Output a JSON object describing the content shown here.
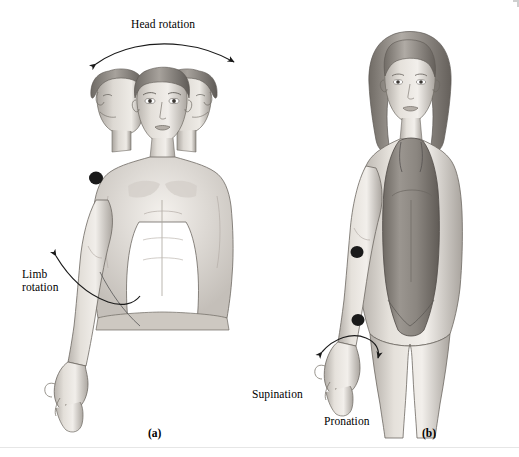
{
  "figure": {
    "background_color": "#ffffff",
    "ink_color": "#1a1a1a"
  },
  "panel_a": {
    "letter": "(a)",
    "subject": "male-figure-three-head-positions-torso",
    "labels": {
      "head_rotation": "Head rotation",
      "limb_rotation": "Limb\nrotation"
    },
    "markers": [
      {
        "name": "shoulder-joint-marker"
      },
      {
        "name": "elbow-pivot-marker"
      }
    ]
  },
  "panel_b": {
    "letter": "(b)",
    "subject": "female-figure-in-swimsuit-forearm-rotation",
    "labels": {
      "supination": "Supination",
      "pronation": "Pronation"
    },
    "markers": [
      {
        "name": "elbow-joint-marker"
      },
      {
        "name": "forearm-rotation-marker"
      }
    ]
  }
}
